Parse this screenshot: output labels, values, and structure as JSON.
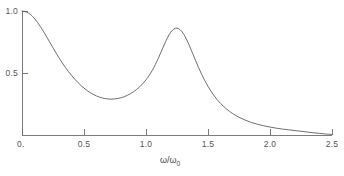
{
  "figure": {
    "background_color": "#ffffff",
    "axis_color": "#6e6e6e",
    "curve_color": "#555555",
    "text_color": "#4a4a4a"
  },
  "axis_title": {
    "numerator": "ω/ω",
    "subscript": "0",
    "full": "ω/ω₀"
  },
  "x_ticks": [
    {
      "value": 0,
      "label": "0."
    },
    {
      "value": 0.5,
      "label": "0.5"
    },
    {
      "value": 1.0,
      "label": "1.0"
    },
    {
      "value": 1.5,
      "label": "1.5"
    },
    {
      "value": 2.0,
      "label": "2.0"
    },
    {
      "value": 2.5,
      "label": "2.5"
    }
  ],
  "y_ticks": [
    {
      "value": 0,
      "label": "0."
    },
    {
      "value": 0.5,
      "label": "0.5"
    },
    {
      "value": 1.0,
      "label": "1.0"
    }
  ],
  "chart_data": {
    "type": "line",
    "title": "",
    "subtitle": "",
    "xlabel": "ω/ω₀",
    "ylabel": "",
    "xlim": [
      0,
      2.5
    ],
    "ylim": [
      0,
      1.0
    ],
    "grid": false,
    "legend": null,
    "annotations": [],
    "series": [
      {
        "name": "response",
        "x": [
          0.0,
          0.05,
          0.1,
          0.15,
          0.2,
          0.25,
          0.3,
          0.35,
          0.4,
          0.45,
          0.5,
          0.55,
          0.6,
          0.65,
          0.7,
          0.75,
          0.8,
          0.85,
          0.9,
          0.95,
          1.0,
          1.05,
          1.1,
          1.15,
          1.2,
          1.25,
          1.3,
          1.35,
          1.4,
          1.45,
          1.5,
          1.55,
          1.6,
          1.65,
          1.7,
          1.75,
          1.8,
          1.85,
          1.9,
          1.95,
          2.0,
          2.05,
          2.1,
          2.15,
          2.2,
          2.25,
          2.3,
          2.35,
          2.4,
          2.45,
          2.5
        ],
        "y": [
          1.0,
          0.985,
          0.94,
          0.872,
          0.79,
          0.703,
          0.62,
          0.545,
          0.48,
          0.424,
          0.378,
          0.342,
          0.315,
          0.298,
          0.29,
          0.291,
          0.301,
          0.32,
          0.349,
          0.39,
          0.445,
          0.52,
          0.62,
          0.735,
          0.83,
          0.862,
          0.82,
          0.72,
          0.6,
          0.487,
          0.392,
          0.316,
          0.256,
          0.209,
          0.172,
          0.143,
          0.12,
          0.101,
          0.086,
          0.074,
          0.064,
          0.055,
          0.048,
          0.042,
          0.036,
          0.03,
          0.024,
          0.018,
          0.013,
          0.008,
          0.004
        ]
      }
    ],
    "features": {
      "start_value": 1.0,
      "trough": {
        "x": 0.68,
        "y": 0.29
      },
      "peak": {
        "x": 1.23,
        "y": 0.86
      },
      "tail_merges_at_x": 2.25
    }
  }
}
